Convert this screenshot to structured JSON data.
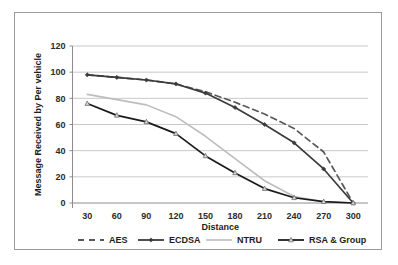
{
  "chart_data": {
    "type": "line",
    "title": "",
    "xlabel": "Distance",
    "ylabel": "Message Received  by Per vehicle",
    "x": [
      30,
      60,
      90,
      120,
      150,
      180,
      210,
      240,
      270,
      300
    ],
    "xticklabels": [
      "30",
      "60",
      "90",
      "120",
      "150",
      "180",
      "210",
      "240",
      "270",
      "300"
    ],
    "yticklabels": [
      "0",
      "20",
      "40",
      "60",
      "80",
      "100",
      "120"
    ],
    "yticks": [
      0,
      20,
      40,
      60,
      80,
      100,
      120
    ],
    "ylim": [
      0,
      120
    ],
    "grid": true,
    "legend_position": "bottom",
    "series": [
      {
        "name": "AES",
        "style": "dashed",
        "marker": "none",
        "color": "#585858",
        "values": [
          98,
          96,
          94,
          91,
          85,
          77,
          68,
          57,
          39,
          0
        ]
      },
      {
        "name": "ECDSA",
        "style": "solid",
        "marker": "diamond",
        "color": "#3b3b3b",
        "values": [
          98,
          96,
          94,
          91,
          84,
          73,
          60,
          46,
          26,
          0
        ]
      },
      {
        "name": "NTRU",
        "style": "solid",
        "marker": "none",
        "color": "#bdbdbd",
        "values": [
          83,
          79,
          75,
          66,
          51,
          34,
          17,
          5,
          1,
          0
        ]
      },
      {
        "name": "RSA & Group",
        "style": "solid",
        "marker": "triangle",
        "color": "#1a1a1a",
        "values": [
          76,
          67,
          62,
          53,
          36,
          23,
          11,
          4,
          1,
          0
        ]
      }
    ]
  },
  "legend": {
    "items": [
      {
        "label": "AES"
      },
      {
        "label": "ECDSA"
      },
      {
        "label": "NTRU"
      },
      {
        "label": "RSA & Group"
      }
    ]
  },
  "colors": {
    "frame": "#9a9a9a",
    "grid": "#c9c9c9",
    "axis": "#8c8c8c",
    "text": "#1d1d1d",
    "background": "#ffffff"
  }
}
